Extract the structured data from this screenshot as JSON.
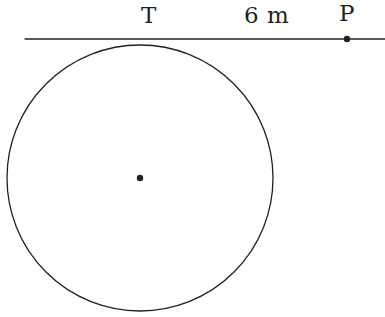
{
  "figure": {
    "type": "geometry-diagram",
    "background_color": "#ffffff",
    "stroke_color": "#231f20",
    "labels": {
      "tangent_point": "T",
      "external_point": "P",
      "segment_length": "6 m"
    },
    "geometry": {
      "canvas": {
        "width": 385,
        "height": 317
      },
      "tangent_line": {
        "x1": 25,
        "y1": 39,
        "x2": 385,
        "y2": 39,
        "stroke_width": 1.3
      },
      "circle": {
        "cx": 140,
        "cy": 178,
        "r": 133,
        "stroke_width": 1.3
      },
      "center_point": {
        "cx": 140,
        "cy": 178,
        "r": 3.2
      },
      "tangent_point_marker": {
        "cx": 140,
        "cy": 45
      },
      "external_point": {
        "cx": 347,
        "cy": 39,
        "r": 3.2
      }
    }
  }
}
